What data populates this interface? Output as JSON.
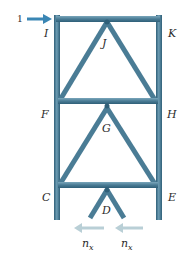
{
  "diagram": {
    "type": "truss-tower",
    "load_label": "1",
    "nodes": {
      "I": "I",
      "J": "J",
      "K": "K",
      "F": "F",
      "G": "G",
      "H": "H",
      "C": "C",
      "D": "D",
      "E": "E"
    },
    "bottom_labels": [
      "n",
      "n"
    ],
    "bottom_subscripts": [
      "x",
      "x"
    ],
    "colors": {
      "member": "#4a7c95",
      "member_dark": "#2f5f78",
      "load_arrow": "#3a86b4",
      "reaction_arrow": "#b9cfd6",
      "text": "#2b2b2b"
    }
  }
}
